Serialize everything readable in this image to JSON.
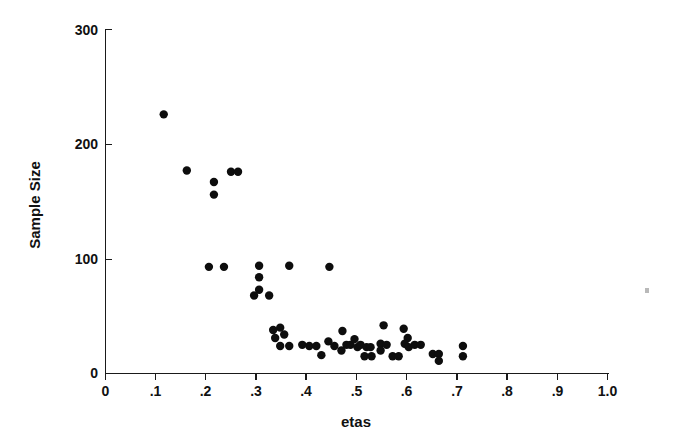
{
  "chart_data": {
    "type": "scatter",
    "title": "",
    "xlabel": "etas",
    "ylabel": "Sample Size",
    "xlim": [
      0,
      1.0
    ],
    "ylim": [
      0,
      300
    ],
    "grid": false,
    "legend": null,
    "x_ticks": [
      0,
      0.1,
      0.2,
      0.3,
      0.4,
      0.5,
      0.6,
      0.7,
      0.8,
      0.9,
      1.0
    ],
    "x_tick_labels": [
      "0",
      ".1",
      ".2",
      ".3",
      ".4",
      ".5",
      ".6",
      ".7",
      ".8",
      ".9",
      "1.0"
    ],
    "y_ticks": [
      0,
      100,
      200,
      300
    ],
    "y_tick_labels": [
      "0",
      "100",
      "200",
      "300"
    ],
    "marker": "filled-circle",
    "marker_color": "#0d0d0d",
    "marker_size_px": 4.6,
    "n_points": 55,
    "points": [
      {
        "x": 0.116,
        "y": 226
      },
      {
        "x": 0.162,
        "y": 177
      },
      {
        "x": 0.216,
        "y": 167
      },
      {
        "x": 0.216,
        "y": 156
      },
      {
        "x": 0.25,
        "y": 176
      },
      {
        "x": 0.264,
        "y": 176
      },
      {
        "x": 0.206,
        "y": 93
      },
      {
        "x": 0.236,
        "y": 93
      },
      {
        "x": 0.306,
        "y": 94
      },
      {
        "x": 0.306,
        "y": 84
      },
      {
        "x": 0.306,
        "y": 73
      },
      {
        "x": 0.366,
        "y": 94
      },
      {
        "x": 0.446,
        "y": 93
      },
      {
        "x": 0.296,
        "y": 68
      },
      {
        "x": 0.326,
        "y": 68
      },
      {
        "x": 0.348,
        "y": 40
      },
      {
        "x": 0.356,
        "y": 34
      },
      {
        "x": 0.348,
        "y": 24
      },
      {
        "x": 0.366,
        "y": 24
      },
      {
        "x": 0.406,
        "y": 24
      },
      {
        "x": 0.42,
        "y": 24
      },
      {
        "x": 0.444,
        "y": 28
      },
      {
        "x": 0.456,
        "y": 24
      },
      {
        "x": 0.472,
        "y": 37
      },
      {
        "x": 0.48,
        "y": 25
      },
      {
        "x": 0.488,
        "y": 25
      },
      {
        "x": 0.496,
        "y": 30
      },
      {
        "x": 0.502,
        "y": 23
      },
      {
        "x": 0.508,
        "y": 25
      },
      {
        "x": 0.52,
        "y": 23
      },
      {
        "x": 0.528,
        "y": 23
      },
      {
        "x": 0.516,
        "y": 15
      },
      {
        "x": 0.53,
        "y": 15
      },
      {
        "x": 0.554,
        "y": 42
      },
      {
        "x": 0.548,
        "y": 26
      },
      {
        "x": 0.548,
        "y": 20
      },
      {
        "x": 0.56,
        "y": 25
      },
      {
        "x": 0.572,
        "y": 15
      },
      {
        "x": 0.584,
        "y": 15
      },
      {
        "x": 0.594,
        "y": 39
      },
      {
        "x": 0.602,
        "y": 31
      },
      {
        "x": 0.596,
        "y": 26
      },
      {
        "x": 0.604,
        "y": 23
      },
      {
        "x": 0.616,
        "y": 25
      },
      {
        "x": 0.628,
        "y": 25
      },
      {
        "x": 0.652,
        "y": 17
      },
      {
        "x": 0.664,
        "y": 17
      },
      {
        "x": 0.664,
        "y": 11
      },
      {
        "x": 0.712,
        "y": 24
      },
      {
        "x": 0.712,
        "y": 15
      },
      {
        "x": 0.43,
        "y": 16
      },
      {
        "x": 0.392,
        "y": 25
      },
      {
        "x": 0.334,
        "y": 38
      },
      {
        "x": 0.338,
        "y": 31
      },
      {
        "x": 0.47,
        "y": 20
      }
    ]
  },
  "figure": {
    "background_color": "#ffffff",
    "axis_color": "#1a1a1a",
    "text_color": "#111111"
  }
}
